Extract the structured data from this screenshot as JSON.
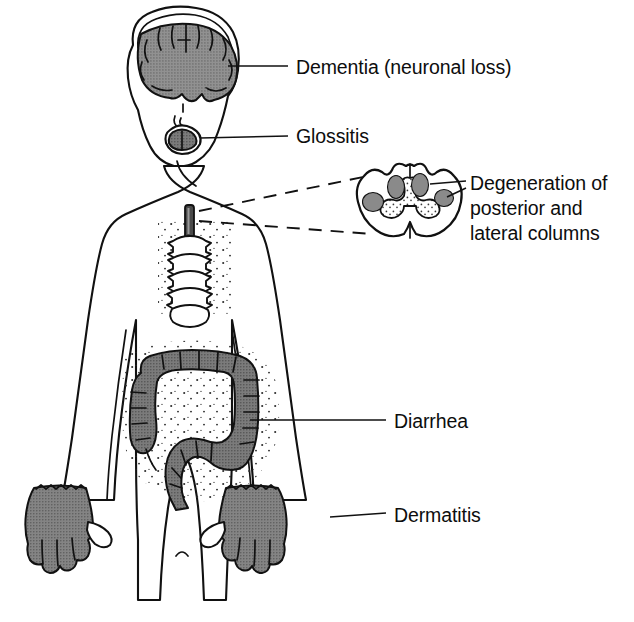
{
  "figure": {
    "background_color": "#ffffff",
    "ink_color": "#111111",
    "width": 634,
    "height": 622
  },
  "palette": {
    "brain_gray": "#8b8b8b",
    "tongue_gray": "#6f6f6f",
    "colon_gray": "#6e6e6e",
    "hand_gray": "#7c7c7c",
    "cord_lesion_gray": "#8a8a8a",
    "gray_matter_stipple": "#f2f2f2",
    "spinal_cord_dark": "#4a4a4a",
    "outline": "#111111",
    "paper": "#ffffff"
  },
  "labels": [
    {
      "id": "dementia",
      "text": "Dementia (neuronal loss)",
      "lines": [
        "Dementia (neuronal loss)"
      ],
      "text_x": 296,
      "text_y": 74,
      "leader": {
        "x1": 228,
        "y1": 66,
        "x2": 288,
        "y2": 66
      },
      "target": "brain"
    },
    {
      "id": "glossitis",
      "text": "Glossitis",
      "lines": [
        "Glossitis"
      ],
      "text_x": 296,
      "text_y": 142,
      "leader": {
        "x1": 203,
        "y1": 134,
        "x2": 288,
        "y2": 134
      },
      "target": "tongue"
    },
    {
      "id": "degeneration",
      "text": "Degeneration of posterior and lateral columns",
      "lines": [
        "Degeneration of",
        "posterior and",
        "lateral columns"
      ],
      "text_x": 470,
      "text_y": 190,
      "line_height": 25,
      "leader_upper": {
        "x1": 432,
        "y1": 185,
        "x2": 466,
        "y2": 183
      },
      "leader_lower": {
        "x1": 446,
        "y1": 199,
        "x2": 466,
        "y2": 190
      },
      "target": "spinal-cord-cross-section"
    },
    {
      "id": "diarrhea",
      "text": "Diarrhea",
      "lines": [
        "Diarrhea"
      ],
      "text_x": 394,
      "text_y": 427,
      "leader": {
        "x1": 251,
        "y1": 420,
        "x2": 386,
        "y2": 420
      },
      "target": "large-intestine"
    },
    {
      "id": "dermatitis",
      "text": "Dermatitis",
      "lines": [
        "Dermatitis"
      ],
      "text_x": 394,
      "text_y": 521,
      "leader": {
        "x1": 330,
        "y1": 516,
        "x2": 386,
        "y2": 514
      },
      "target": "right-hand"
    }
  ],
  "anatomy": {
    "figure_kind": "anterior-view-human-body-outline",
    "parts": [
      {
        "id": "head",
        "name": "head-and-skull",
        "shaded": false
      },
      {
        "id": "brain",
        "name": "brain-coronal-section",
        "shaded": true,
        "shade": "#8b8b8b"
      },
      {
        "id": "nose",
        "name": "nose",
        "shaded": false
      },
      {
        "id": "mouth",
        "name": "mouth",
        "shaded": false
      },
      {
        "id": "tongue",
        "name": "tongue",
        "shaded": true,
        "shade": "#6f6f6f"
      },
      {
        "id": "torso",
        "name": "torso-and-arms",
        "shaded": false
      },
      {
        "id": "vertebral-column",
        "name": "vertebral-column",
        "shaded": false,
        "vertebra_count": 5
      },
      {
        "id": "spinal-cord-segment",
        "name": "spinal-cord-segment",
        "shaded": true,
        "shade": "#4a4a4a"
      },
      {
        "id": "large-intestine",
        "name": "large-intestine-colon",
        "shaded": true,
        "shade": "#6e6e6e"
      },
      {
        "id": "left-hand",
        "name": "left-hand",
        "shaded": true,
        "shade": "#7c7c7c"
      },
      {
        "id": "right-hand",
        "name": "right-hand",
        "shaded": true,
        "shade": "#7c7c7c"
      },
      {
        "id": "legs",
        "name": "legs",
        "shaded": false
      }
    ]
  },
  "inset": {
    "id": "spinal-cord-cross-section",
    "name": "spinal-cord-cross-section",
    "center_x": 410,
    "center_y": 205,
    "lesion_count": 4,
    "lesions": [
      {
        "id": "posterior-left",
        "cx": 396,
        "cy": 187,
        "rx": 9,
        "ry": 12,
        "column": "posterior"
      },
      {
        "id": "posterior-right",
        "cx": 419,
        "cy": 185,
        "rx": 9,
        "ry": 12,
        "column": "posterior"
      },
      {
        "id": "lateral-left",
        "cx": 374,
        "cy": 202,
        "rx": 11,
        "ry": 10,
        "column": "lateral"
      },
      {
        "id": "lateral-right",
        "cx": 441,
        "cy": 199,
        "rx": 10,
        "ry": 9,
        "column": "lateral"
      }
    ]
  },
  "dashed_connectors": [
    {
      "id": "upper-connector",
      "from_x": 240,
      "from_y": 196,
      "to_x": 368,
      "to_y": 176
    },
    {
      "id": "lower-connector",
      "from_x": 240,
      "from_y": 214,
      "to_x": 372,
      "to_y": 235
    }
  ]
}
